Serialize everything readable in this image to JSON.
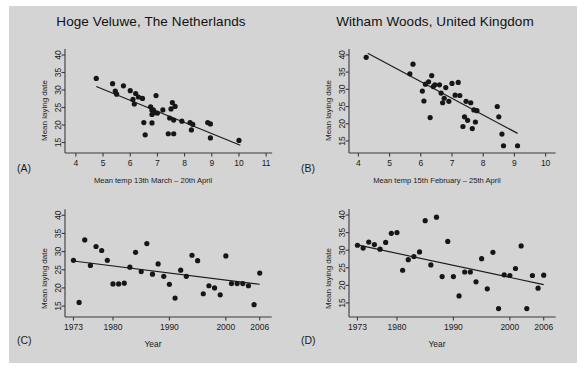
{
  "figure": {
    "background_color": "#d4d4d4",
    "point_color": "#161616",
    "line_color": "#1a1a1a",
    "axis_color": "#3a3a3a"
  },
  "panels": [
    {
      "tag": "(A)",
      "title": "Hoge Veluwe, The Netherlands",
      "xlabel": "Mean temp 13th March – 20th April",
      "ylabel": "Mean laying date",
      "chart_data": {
        "type": "scatter",
        "title": "Hoge Veluwe, The Netherlands",
        "xlabel": "Mean temp 13th March – 20th April",
        "ylabel": "Mean laying date",
        "xlim": [
          3.6,
          11.4
        ],
        "ylim": [
          12.0,
          42.0
        ],
        "xticks": [
          4,
          5,
          6,
          7,
          8,
          9,
          10,
          11
        ],
        "yticks": [
          15,
          20,
          25,
          30,
          35,
          40
        ],
        "grid": false,
        "legend": "none",
        "x": [
          4.75,
          5.35,
          5.45,
          5.5,
          5.75,
          6.0,
          6.1,
          6.15,
          6.2,
          6.3,
          6.45,
          6.5,
          6.55,
          6.75,
          6.8,
          6.8,
          6.8,
          6.85,
          6.9,
          6.95,
          7.0,
          7.2,
          7.4,
          7.45,
          7.5,
          7.55,
          7.6,
          7.6,
          7.65,
          7.9,
          8.2,
          8.25,
          8.3,
          8.85,
          8.95,
          8.95,
          10.0
        ],
        "y": [
          33.3,
          31.8,
          29.7,
          28.8,
          31.2,
          29.8,
          27.3,
          26.0,
          29.0,
          28.0,
          27.6,
          20.7,
          17.2,
          25.2,
          24.2,
          23.0,
          20.6,
          24.3,
          23.5,
          28.4,
          23.4,
          24.3,
          17.5,
          22.0,
          24.6,
          26.4,
          21.4,
          17.5,
          25.3,
          21.1,
          20.7,
          18.6,
          20.2,
          20.7,
          20.3,
          16.3,
          15.6
        ],
        "trend_line": {
          "x0": 4.75,
          "y0": 31.0,
          "x1": 10.05,
          "y1": 14.2
        }
      }
    },
    {
      "tag": "(B)",
      "title": "Witham Woods, United Kingdom",
      "xlabel": "Mean temp 15th February – 25th April",
      "ylabel": "Mean laying date",
      "chart_data": {
        "type": "scatter",
        "title": "Witham Woods, United Kingdom",
        "xlabel": "Mean temp 15th February – 25th April",
        "ylabel": "Mean laying date",
        "xlim": [
          3.7,
          10.3
        ],
        "ylim": [
          11.5,
          42.0
        ],
        "xticks": [
          4,
          5,
          6,
          7,
          8,
          9,
          10
        ],
        "yticks": [
          15,
          20,
          25,
          30,
          35,
          40
        ],
        "grid": false,
        "legend": "none",
        "x": [
          4.25,
          5.65,
          5.75,
          6.05,
          6.1,
          6.15,
          6.25,
          6.3,
          6.35,
          6.4,
          6.45,
          6.6,
          6.65,
          6.7,
          6.75,
          6.8,
          6.9,
          7.0,
          7.1,
          7.2,
          7.25,
          7.35,
          7.4,
          7.45,
          7.5,
          7.6,
          7.65,
          7.7,
          7.75,
          7.8,
          8.45,
          8.5,
          8.6,
          8.65,
          9.1
        ],
        "y": [
          39.3,
          34.5,
          37.3,
          29.5,
          26.6,
          31.5,
          32.2,
          21.8,
          34.0,
          30.8,
          31.3,
          31.3,
          28.9,
          26.1,
          27.4,
          30.5,
          26.5,
          31.7,
          28.3,
          32.0,
          28.2,
          19.2,
          22.0,
          26.5,
          21.0,
          26.1,
          18.6,
          24.0,
          20.5,
          23.8,
          25.0,
          22.0,
          17.0,
          13.6,
          13.6
        ],
        "trend_line": {
          "x0": 4.3,
          "y0": 40.5,
          "x1": 9.1,
          "y1": 17.2
        }
      }
    },
    {
      "tag": "(C)",
      "title": "",
      "xlabel": "Year",
      "ylabel": "Mean laying date",
      "chart_data": {
        "type": "scatter",
        "title": "",
        "xlabel": "Year",
        "ylabel": "Mean laying date",
        "xlim": [
          1971.5,
          2008.0
        ],
        "ylim": [
          12.0,
          42.0
        ],
        "xticks": [
          1973,
          1980,
          1990,
          2000,
          2006
        ],
        "yticks": [
          15,
          20,
          25,
          30,
          35,
          40
        ],
        "grid": false,
        "legend": "none",
        "x": [
          1973,
          1974,
          1975,
          1976,
          1977,
          1978,
          1979,
          1980,
          1981,
          1982,
          1983,
          1984,
          1985,
          1986,
          1987,
          1988,
          1989,
          1990,
          1991,
          1992,
          1993,
          1994,
          1995,
          1996,
          1997,
          1998,
          1999,
          2000,
          2001,
          2002,
          2003,
          2004,
          2005,
          2006
        ],
        "y": [
          27.6,
          16.0,
          33.2,
          26.2,
          31.4,
          30.3,
          27.6,
          21.1,
          21.1,
          21.3,
          25.7,
          29.8,
          24.5,
          32.2,
          23.8,
          26.6,
          23.2,
          21.0,
          17.2,
          24.9,
          23.2,
          29.0,
          27.5,
          18.4,
          20.6,
          20.0,
          18.1,
          28.8,
          21.2,
          21.2,
          21.2,
          20.6,
          15.4,
          24.1
        ],
        "trend_line": {
          "x0": 1973,
          "y0": 27.4,
          "x1": 2006,
          "y1": 21.0
        }
      }
    },
    {
      "tag": "(D)",
      "title": "",
      "xlabel": "Year",
      "ylabel": "Mean laying date",
      "chart_data": {
        "type": "scatter",
        "title": "",
        "xlabel": "Year",
        "ylabel": "Mean laying date",
        "xlim": [
          1971.5,
          2008.0
        ],
        "ylim": [
          11.0,
          42.0
        ],
        "xticks": [
          1973,
          1980,
          1990,
          2000,
          2006
        ],
        "yticks": [
          15,
          20,
          25,
          30,
          35,
          40
        ],
        "grid": false,
        "legend": "none",
        "x": [
          1973,
          1974,
          1975,
          1976,
          1977,
          1978,
          1979,
          1980,
          1981,
          1982,
          1983,
          1984,
          1985,
          1986,
          1987,
          1988,
          1989,
          1990,
          1991,
          1992,
          1993,
          1994,
          1995,
          1996,
          1997,
          1998,
          1999,
          2000,
          2001,
          2002,
          2003,
          2004,
          2005,
          2006
        ],
        "y": [
          31.4,
          30.6,
          32.3,
          31.6,
          30.3,
          32.2,
          34.8,
          35.0,
          24.3,
          27.3,
          28.2,
          29.5,
          38.4,
          25.8,
          39.4,
          22.5,
          32.5,
          22.5,
          17.0,
          23.8,
          23.8,
          21.0,
          27.6,
          19.0,
          29.4,
          13.4,
          23.0,
          22.8,
          24.8,
          31.2,
          13.4,
          22.8,
          19.2,
          22.9
        ],
        "trend_line": {
          "x0": 1973,
          "y0": 31.5,
          "x1": 2006,
          "y1": 20.2
        }
      }
    }
  ]
}
